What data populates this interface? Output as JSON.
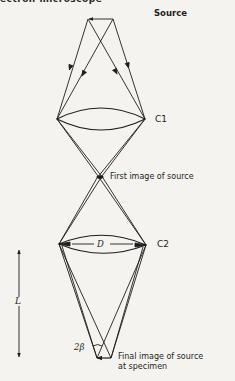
{
  "header": {
    "text": "ectron microscope"
  },
  "labels": {
    "source": "Source",
    "c1": "C1",
    "first_image": "First image of source",
    "c2": "C2",
    "aperture_diameter": "D",
    "length": "L",
    "angle": "2β",
    "final_image_line1": "Final image of source",
    "final_image_line2": "at specimen"
  },
  "colors": {
    "ink": "#1e1e1e",
    "paper": "#f4f3ef"
  }
}
